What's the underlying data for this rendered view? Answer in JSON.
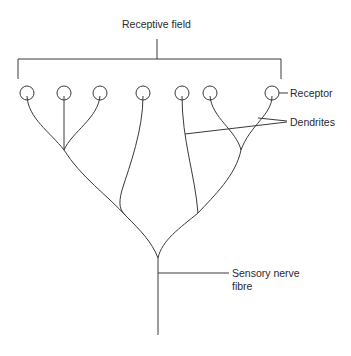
{
  "diagram": {
    "title": "Receptive field",
    "labels": {
      "receptor": "Receptor",
      "dendrites": "Dendrites",
      "nerve_line1": "Sensory nerve",
      "nerve_line2": "fibre"
    },
    "receptor_count": 7,
    "line_color": "#3a3a3a",
    "background": "#ffffff"
  }
}
